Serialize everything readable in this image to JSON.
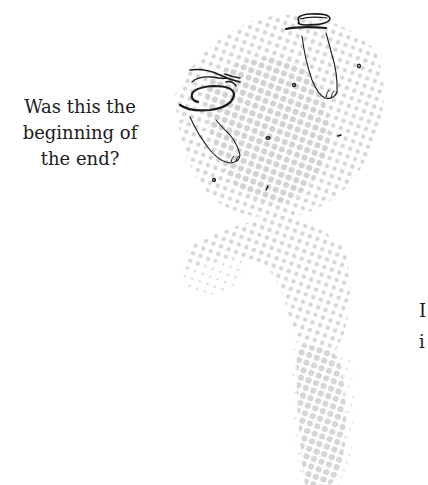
{
  "caption": {
    "lines": [
      "Was this the",
      "beginning of",
      "the end?"
    ]
  },
  "side_text": {
    "lines": [
      "I",
      "i"
    ]
  },
  "illustration": {
    "description": "halftone dotted silhouette of a figure with two sketched feet/legs wearing sandals",
    "dot_color": "#d9d9d9",
    "line_color": "#1a1a1a"
  }
}
